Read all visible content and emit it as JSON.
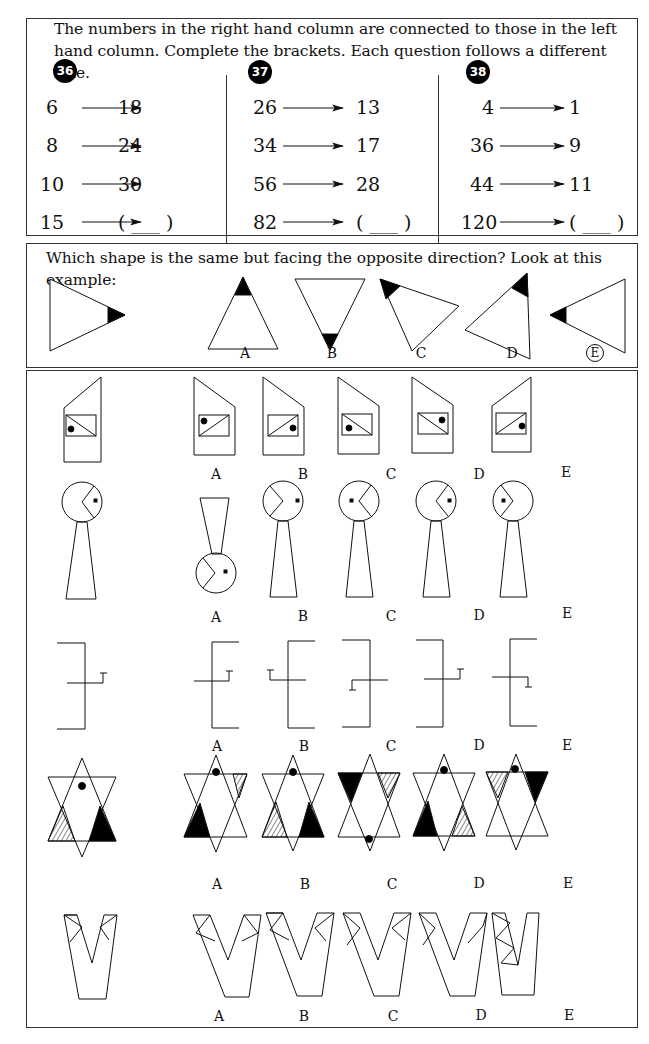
{
  "section1": {
    "instruction": "The numbers in the right hand column are connected to those in the left hand column. Complete the brackets. Each question follows a different rule.",
    "questions": [
      {
        "number": "36",
        "rows": [
          {
            "left": "6",
            "right": "18"
          },
          {
            "left": "8",
            "right": "24"
          },
          {
            "left": "10",
            "right": "30"
          },
          {
            "left": "15",
            "right": "( ___ )"
          }
        ]
      },
      {
        "number": "37",
        "rows": [
          {
            "left": "26",
            "right": "13"
          },
          {
            "left": "34",
            "right": "17"
          },
          {
            "left": "56",
            "right": "28"
          },
          {
            "left": "82",
            "right": "( ___ )"
          }
        ]
      },
      {
        "number": "38",
        "rows": [
          {
            "left": "4",
            "right": "1"
          },
          {
            "left": "36",
            "right": "9"
          },
          {
            "left": "44",
            "right": "11"
          },
          {
            "left": "120",
            "right": "( ___ )"
          }
        ]
      }
    ]
  },
  "section2": {
    "instruction": "Which shape is the same but facing the opposite direction? Look at this example:",
    "option_labels": [
      "A",
      "B",
      "C",
      "D",
      "E"
    ],
    "answer": "E"
  },
  "section3": {
    "option_labels": [
      "A",
      "B",
      "C",
      "D",
      "E"
    ],
    "rows": [
      {
        "shape": "house-pentagon-with-rectangle-and-dot"
      },
      {
        "shape": "keyhole-circle-with-notch-and-dot"
      },
      {
        "shape": "bracket-with-cross-line-and-tick"
      },
      {
        "shape": "star-of-david-with-shaded-triangles"
      },
      {
        "shape": "v-shape-with-corner-triangles"
      }
    ]
  }
}
